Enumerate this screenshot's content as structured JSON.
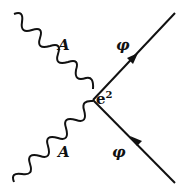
{
  "diagram": {
    "type": "feynman-vertex",
    "vertex": {
      "x": 93,
      "y": 100,
      "label": "e",
      "label_sup": "2"
    },
    "lines": [
      {
        "kind": "photon",
        "label": "A",
        "from": [
          14,
          14
        ],
        "to": [
          93,
          100
        ]
      },
      {
        "kind": "photon",
        "label": "A",
        "from": [
          14,
          182
        ],
        "to": [
          93,
          100
        ]
      },
      {
        "kind": "scalar",
        "label": "φ",
        "from": [
          93,
          100
        ],
        "to": [
          175,
          13
        ],
        "arrow": "outgoing"
      },
      {
        "kind": "scalar",
        "label": "φ",
        "from": [
          175,
          183
        ],
        "to": [
          93,
          100
        ],
        "arrow": "incoming"
      }
    ],
    "labels": {
      "photon_top": "A",
      "photon_bottom": "A",
      "scalar_top": "φ",
      "scalar_bottom": "φ",
      "vertex_e": "e",
      "vertex_sup": "2"
    }
  }
}
